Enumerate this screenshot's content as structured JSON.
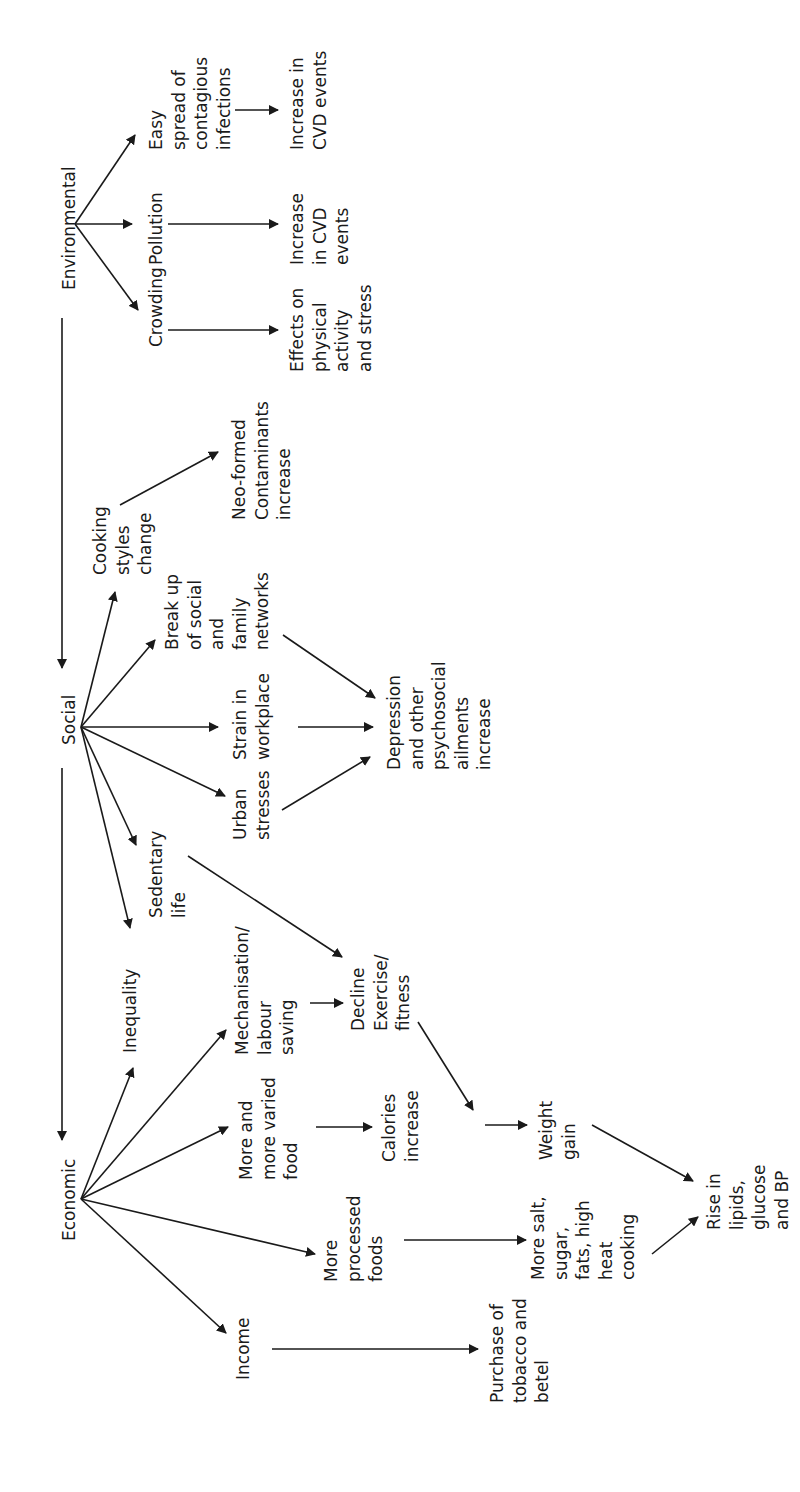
{
  "diagram": {
    "orientation": "rotated-90-ccw",
    "colors": {
      "ink": "#1a1a1a",
      "background": "#ffffff"
    },
    "nodes": [
      {
        "id": "environmental",
        "lines": [
          "Environmental"
        ],
        "x": 75,
        "y": 290
      },
      {
        "id": "crowding",
        "lines": [
          "Crowding"
        ],
        "x": 162,
        "y": 347
      },
      {
        "id": "pollution",
        "lines": [
          "Pollution"
        ],
        "x": 162,
        "y": 265
      },
      {
        "id": "easy-spread",
        "lines": [
          "Easy",
          "spread of",
          "contagious",
          "infections"
        ],
        "x": 162,
        "y": 150
      },
      {
        "id": "effects-physical",
        "lines": [
          "Effects on",
          "physical",
          "activity",
          "and stress"
        ],
        "x": 303,
        "y": 372
      },
      {
        "id": "increase-cvd-mid",
        "lines": [
          "Increase",
          "in CVD",
          "events"
        ],
        "x": 303,
        "y": 265
      },
      {
        "id": "increase-cvd-top",
        "lines": [
          "Increase in",
          "CVD events"
        ],
        "x": 303,
        "y": 150
      },
      {
        "id": "social",
        "lines": [
          "Social"
        ],
        "x": 75,
        "y": 745
      },
      {
        "id": "cooking-styles",
        "lines": [
          "Cooking",
          "styles",
          "change"
        ],
        "x": 106,
        "y": 575
      },
      {
        "id": "neo-formed",
        "lines": [
          "Neo-formed",
          "Contaminants",
          "increase"
        ],
        "x": 245,
        "y": 520
      },
      {
        "id": "break-up",
        "lines": [
          "Break up",
          "of social",
          "and",
          "family",
          "networks"
        ],
        "x": 178,
        "y": 650
      },
      {
        "id": "strain-workplace",
        "lines": [
          "Strain in",
          "workplace"
        ],
        "x": 246,
        "y": 760
      },
      {
        "id": "urban-stresses",
        "lines": [
          "Urban",
          "stresses"
        ],
        "x": 246,
        "y": 840
      },
      {
        "id": "depression",
        "lines": [
          "Depression",
          "and other",
          "psychosocial",
          "ailments",
          "increase"
        ],
        "x": 400,
        "y": 770
      },
      {
        "id": "sedentary",
        "lines": [
          "Sedentary",
          "life"
        ],
        "x": 162,
        "y": 918
      },
      {
        "id": "economic",
        "lines": [
          "Economic"
        ],
        "x": 75,
        "y": 1241
      },
      {
        "id": "inequality",
        "lines": [
          "Inequality"
        ],
        "x": 136,
        "y": 1053
      },
      {
        "id": "mechanisation",
        "lines": [
          "Mechanisation/",
          "labour",
          "saving"
        ],
        "x": 248,
        "y": 1055
      },
      {
        "id": "decline-exercise",
        "lines": [
          "Decline",
          "Exercise/",
          "fitness"
        ],
        "x": 364,
        "y": 1031
      },
      {
        "id": "more-varied-food",
        "lines": [
          "More and",
          "more varied",
          "food"
        ],
        "x": 252,
        "y": 1180
      },
      {
        "id": "calories",
        "lines": [
          "Calories",
          "increase"
        ],
        "x": 395,
        "y": 1162
      },
      {
        "id": "weight-gain",
        "lines": [
          "Weight",
          "gain"
        ],
        "x": 552,
        "y": 1160
      },
      {
        "id": "more-processed",
        "lines": [
          "More",
          "processed",
          "foods"
        ],
        "x": 337,
        "y": 1282
      },
      {
        "id": "more-salt",
        "lines": [
          "More salt,",
          "sugar,",
          "fats, high",
          "heat",
          "cooking"
        ],
        "x": 544,
        "y": 1280
      },
      {
        "id": "rise-lipids",
        "lines": [
          "Rise in",
          "lipids,",
          "glucose",
          "and BP"
        ],
        "x": 720,
        "y": 1230
      },
      {
        "id": "income",
        "lines": [
          "Income"
        ],
        "x": 249,
        "y": 1380
      },
      {
        "id": "purchase-tobacco",
        "lines": [
          "Purchase of",
          "tobacco and",
          "betel"
        ],
        "x": 503,
        "y": 1403
      }
    ],
    "edges": [
      {
        "from": "environmental",
        "to": "social",
        "x1": 62,
        "y1": 318,
        "x2": 62,
        "y2": 668
      },
      {
        "from": "social",
        "to": "economic",
        "x1": 62,
        "y1": 768,
        "x2": 62,
        "y2": 1140
      },
      {
        "from": "environmental",
        "to": "crowding",
        "x1": 75,
        "y1": 224,
        "x2": 138,
        "y2": 310
      },
      {
        "from": "environmental",
        "to": "pollution",
        "x1": 75,
        "y1": 224,
        "x2": 132,
        "y2": 224
      },
      {
        "from": "environmental",
        "to": "easy-spread",
        "x1": 75,
        "y1": 224,
        "x2": 135,
        "y2": 135
      },
      {
        "from": "crowding",
        "to": "effects-physical",
        "x1": 168,
        "y1": 330,
        "x2": 278,
        "y2": 330
      },
      {
        "from": "pollution",
        "to": "increase-cvd-mid",
        "x1": 168,
        "y1": 224,
        "x2": 278,
        "y2": 224
      },
      {
        "from": "easy-spread",
        "to": "increase-cvd-top",
        "x1": 235,
        "y1": 110,
        "x2": 278,
        "y2": 110
      },
      {
        "from": "social",
        "to": "cooking-styles",
        "x1": 81,
        "y1": 727,
        "x2": 115,
        "y2": 592
      },
      {
        "from": "social",
        "to": "break-up",
        "x1": 81,
        "y1": 727,
        "x2": 155,
        "y2": 640
      },
      {
        "from": "social",
        "to": "strain-workplace",
        "x1": 81,
        "y1": 727,
        "x2": 218,
        "y2": 727
      },
      {
        "from": "social",
        "to": "urban-stresses",
        "x1": 81,
        "y1": 727,
        "x2": 225,
        "y2": 796
      },
      {
        "from": "social",
        "to": "sedentary",
        "x1": 81,
        "y1": 727,
        "x2": 136,
        "y2": 845
      },
      {
        "from": "social",
        "to": "inequality",
        "x1": 81,
        "y1": 727,
        "x2": 130,
        "y2": 928
      },
      {
        "from": "cooking-styles",
        "to": "neo-formed",
        "x1": 120,
        "y1": 505,
        "x2": 218,
        "y2": 452
      },
      {
        "from": "break-up",
        "to": "depression",
        "x1": 283,
        "y1": 635,
        "x2": 375,
        "y2": 698
      },
      {
        "from": "strain-workplace",
        "to": "depression",
        "x1": 298,
        "y1": 727,
        "x2": 373,
        "y2": 727
      },
      {
        "from": "urban-stresses",
        "to": "depression",
        "x1": 282,
        "y1": 810,
        "x2": 370,
        "y2": 757
      },
      {
        "from": "sedentary",
        "to": "decline-exercise",
        "x1": 188,
        "y1": 856,
        "x2": 342,
        "y2": 957
      },
      {
        "from": "economic",
        "to": "inequality",
        "x1": 81,
        "y1": 1199,
        "x2": 133,
        "y2": 1068
      },
      {
        "from": "economic",
        "to": "mechanisation",
        "x1": 81,
        "y1": 1199,
        "x2": 226,
        "y2": 1030
      },
      {
        "from": "economic",
        "to": "more-varied-food",
        "x1": 81,
        "y1": 1199,
        "x2": 228,
        "y2": 1127
      },
      {
        "from": "economic",
        "to": "more-processed",
        "x1": 81,
        "y1": 1199,
        "x2": 315,
        "y2": 1254
      },
      {
        "from": "economic",
        "to": "income",
        "x1": 81,
        "y1": 1199,
        "x2": 226,
        "y2": 1333
      },
      {
        "from": "mechanisation",
        "to": "decline-exercise",
        "x1": 310,
        "y1": 1003,
        "x2": 343,
        "y2": 1003
      },
      {
        "from": "more-varied-food",
        "to": "calories",
        "x1": 316,
        "y1": 1127,
        "x2": 372,
        "y2": 1127
      },
      {
        "from": "decline-exercise",
        "to": "weight-gain",
        "x1": 418,
        "y1": 1022,
        "x2": 473,
        "y2": 1110
      },
      {
        "from": "calories",
        "to": "weight-gain",
        "x1": 485,
        "y1": 1125,
        "x2": 527,
        "y2": 1125
      },
      {
        "from": "more-processed",
        "to": "more-salt",
        "x1": 404,
        "y1": 1240,
        "x2": 526,
        "y2": 1240
      },
      {
        "from": "weight-gain",
        "to": "rise-lipids",
        "x1": 592,
        "y1": 1125,
        "x2": 693,
        "y2": 1181
      },
      {
        "from": "more-salt",
        "to": "rise-lipids",
        "x1": 652,
        "y1": 1254,
        "x2": 698,
        "y2": 1217
      },
      {
        "from": "income",
        "to": "purchase-tobacco",
        "x1": 272,
        "y1": 1349,
        "x2": 478,
        "y2": 1349
      }
    ]
  }
}
